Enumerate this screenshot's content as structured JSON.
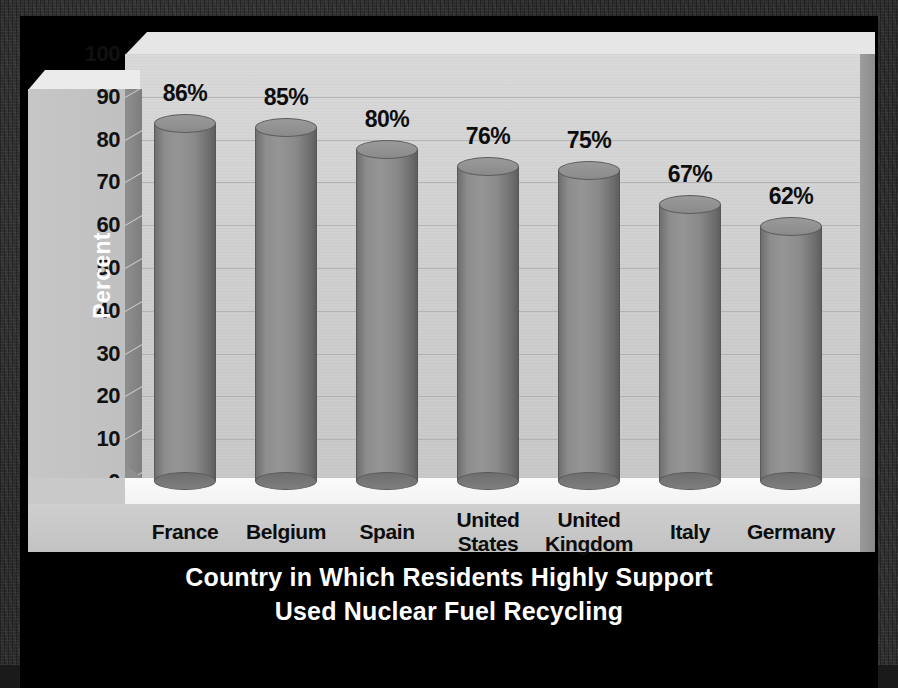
{
  "chart_data": {
    "type": "bar",
    "title": "Country in Which Residents Highly Support Used Nuclear Fuel Recycling",
    "title_lines": [
      "Country in Which Residents Highly Support",
      "Used Nuclear Fuel Recycling"
    ],
    "xlabel": "Country in Which Residents Highly Support Used Nuclear Fuel Recycling",
    "ylabel": "Percent",
    "ylim": [
      0,
      100
    ],
    "ytick_step": 10,
    "yticks": [
      "100",
      "90",
      "80",
      "70",
      "60",
      "50",
      "40",
      "30",
      "20",
      "10",
      "0"
    ],
    "grid": true,
    "legend": "none",
    "style": "3d-cylinder",
    "categories": [
      "France",
      "Belgium",
      "Spain",
      "United States",
      "United Kingdom",
      "Italy",
      "Germany"
    ],
    "category_lines": [
      [
        "France"
      ],
      [
        "Belgium"
      ],
      [
        "Spain"
      ],
      [
        "United",
        "States"
      ],
      [
        "United",
        "Kingdom"
      ],
      [
        "Italy"
      ],
      [
        "Germany"
      ]
    ],
    "values": [
      86,
      85,
      80,
      76,
      75,
      67,
      62
    ],
    "data_labels": [
      "86%",
      "85%",
      "80%",
      "76%",
      "75%",
      "67%",
      "62%"
    ]
  },
  "colors": {
    "background": "#000000",
    "outer_border": "#2b2b2b",
    "wall": "#d4d4d4",
    "floor": "#f7f7f7",
    "bar": "#8d8d8d",
    "title_text": "#ffffff",
    "label_text": "#0d0d0d",
    "gridline": "#a8a8a8"
  }
}
